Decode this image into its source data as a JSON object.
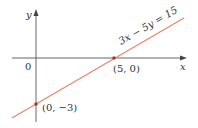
{
  "diagram": {
    "axes": {
      "x_label": "x",
      "y_label": "y",
      "origin_label": "0"
    },
    "line": {
      "equation": "3x − 5y = 15",
      "color": "#e8826a"
    },
    "points": [
      {
        "label": "(5, 0)",
        "x": 5,
        "y": 0
      },
      {
        "label": "(0, −3)",
        "x": 0,
        "y": -3
      }
    ],
    "colors": {
      "axis": "#555555",
      "point": "#a0402a",
      "text": "#333333"
    }
  }
}
